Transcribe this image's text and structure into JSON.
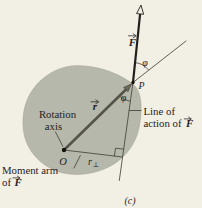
{
  "figure": {
    "caption": "(c)",
    "symbols": {
      "force": "F",
      "radius": "r",
      "point": "P",
      "origin": "O",
      "angle": "φ",
      "moment_arm_base": "r",
      "perp_subscript": "⊥"
    },
    "labels": {
      "rotation_axis_line1": "Rotation",
      "rotation_axis_line2": "axis",
      "line_of_action_line1": "Line of",
      "line_of_action_line2": "action of",
      "moment_arm_line1": "Moment arm",
      "moment_arm_line2": "of"
    },
    "colors": {
      "background": "#f2efe5",
      "body_fill": "#b5b8aa",
      "body_edge": "#a2a695",
      "line": "#46443d",
      "force_vector": "#201f1b",
      "radius_vector": "#55544a",
      "radius_arrowhead": "#6e6c59",
      "text": "#26231e"
    }
  }
}
